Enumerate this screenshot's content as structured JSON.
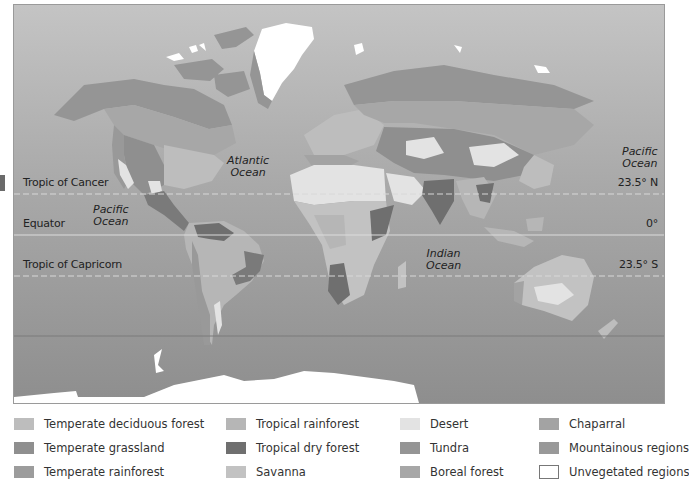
{
  "map": {
    "lines": {
      "tropic_cancer": {
        "label": "Tropic of Cancer",
        "degree": "23.5° N"
      },
      "equator": {
        "label": "Equator",
        "degree": "0°"
      },
      "tropic_capricorn": {
        "label": "Tropic of Capricorn",
        "degree": "23.5° S"
      }
    },
    "oceans": {
      "atlantic": "Atlantic\nOcean",
      "pacific_east": "Pacific\nOcean",
      "pacific_west": "Pacific\nOcean",
      "indian": "Indian\nOcean"
    }
  },
  "legend": {
    "items": [
      {
        "label": "Temperate deciduous forest",
        "color": "#bdbdbd"
      },
      {
        "label": "Temperate grassland",
        "color": "#8f8f8f"
      },
      {
        "label": "Temperate rainforest",
        "color": "#9c9c9c"
      },
      {
        "label": "Tropical rainforest",
        "color": "#b6b6b6"
      },
      {
        "label": "Tropical dry forest",
        "color": "#6f6f6f"
      },
      {
        "label": "Savanna",
        "color": "#c2c2c2"
      },
      {
        "label": "Desert",
        "color": "#e3e3e3"
      },
      {
        "label": "Tundra",
        "color": "#959595"
      },
      {
        "label": "Boreal forest",
        "color": "#a7a7a7"
      },
      {
        "label": "Chaparral",
        "color": "#a3a3a3"
      },
      {
        "label": "Mountainous regions",
        "color": "#999999"
      },
      {
        "label": "Unvegetated regions",
        "color": "#ffffff"
      }
    ]
  }
}
